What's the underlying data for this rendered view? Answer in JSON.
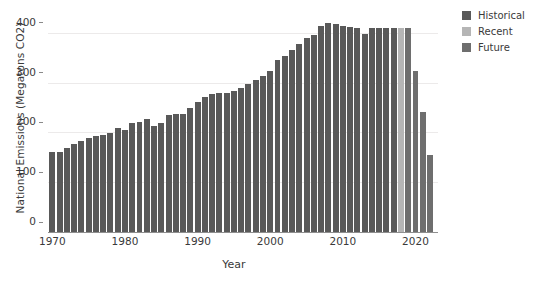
{
  "chart_data": {
    "type": "bar",
    "title": "",
    "xlabel": "Year",
    "ylabel": "National Emissions (Megatons CO2)",
    "xlim": [
      1969.4,
      2023.1
    ],
    "ylim": [
      0,
      440
    ],
    "ytick_labels": [
      "0",
      "100",
      "200",
      "300",
      "400"
    ],
    "ytick_values": [
      0,
      100,
      200,
      300,
      400
    ],
    "xtick_labels": [
      "1970",
      "1980",
      "1990",
      "2000",
      "2010",
      "2020"
    ],
    "xtick_values": [
      1970,
      1980,
      1990,
      2000,
      2010,
      2020
    ],
    "grid": "horizontal-light",
    "legend_position": "upper-right-outside",
    "series": [
      {
        "name": "Historical",
        "color": "#595959",
        "points": [
          {
            "x": 1970,
            "y": 162
          },
          {
            "x": 1971,
            "y": 163
          },
          {
            "x": 1972,
            "y": 170
          },
          {
            "x": 1973,
            "y": 178
          },
          {
            "x": 1974,
            "y": 185
          },
          {
            "x": 1975,
            "y": 190
          },
          {
            "x": 1976,
            "y": 194
          },
          {
            "x": 1977,
            "y": 197
          },
          {
            "x": 1978,
            "y": 200
          },
          {
            "x": 1979,
            "y": 210
          },
          {
            "x": 1980,
            "y": 206
          },
          {
            "x": 1981,
            "y": 221
          },
          {
            "x": 1982,
            "y": 223
          },
          {
            "x": 1983,
            "y": 230
          },
          {
            "x": 1984,
            "y": 215
          },
          {
            "x": 1985,
            "y": 222
          },
          {
            "x": 1986,
            "y": 238
          },
          {
            "x": 1987,
            "y": 240
          },
          {
            "x": 1988,
            "y": 240
          },
          {
            "x": 1989,
            "y": 252
          },
          {
            "x": 1990,
            "y": 263
          },
          {
            "x": 1991,
            "y": 274
          },
          {
            "x": 1992,
            "y": 280
          },
          {
            "x": 1993,
            "y": 281
          },
          {
            "x": 1994,
            "y": 282
          },
          {
            "x": 1995,
            "y": 286
          },
          {
            "x": 1996,
            "y": 291
          },
          {
            "x": 1997,
            "y": 299
          },
          {
            "x": 1998,
            "y": 307
          },
          {
            "x": 1999,
            "y": 316
          },
          {
            "x": 2000,
            "y": 325
          },
          {
            "x": 2001,
            "y": 348
          },
          {
            "x": 2002,
            "y": 355
          },
          {
            "x": 2003,
            "y": 368
          },
          {
            "x": 2004,
            "y": 379
          },
          {
            "x": 2005,
            "y": 391
          },
          {
            "x": 2006,
            "y": 398
          },
          {
            "x": 2007,
            "y": 415
          },
          {
            "x": 2008,
            "y": 421
          },
          {
            "x": 2009,
            "y": 420
          },
          {
            "x": 2010,
            "y": 415
          },
          {
            "x": 2011,
            "y": 414
          },
          {
            "x": 2012,
            "y": 412
          },
          {
            "x": 2013,
            "y": 399
          },
          {
            "x": 2014,
            "y": 412
          },
          {
            "x": 2015,
            "y": 411
          },
          {
            "x": 2016,
            "y": 411
          },
          {
            "x": 2017,
            "y": 411
          }
        ]
      },
      {
        "name": "Recent",
        "color": "#b5b5b5",
        "points": [
          {
            "x": 2018,
            "y": 412
          }
        ]
      },
      {
        "name": "Future",
        "color": "#6e6e6e",
        "points": [
          {
            "x": 2019,
            "y": 411
          },
          {
            "x": 2020,
            "y": 325
          },
          {
            "x": 2021,
            "y": 243
          },
          {
            "x": 2022,
            "y": 156
          }
        ]
      }
    ]
  },
  "legend": {
    "items": [
      {
        "label": "Historical",
        "color": "#595959"
      },
      {
        "label": "Recent",
        "color": "#b5b5b5"
      },
      {
        "label": "Future",
        "color": "#6e6e6e"
      }
    ]
  }
}
